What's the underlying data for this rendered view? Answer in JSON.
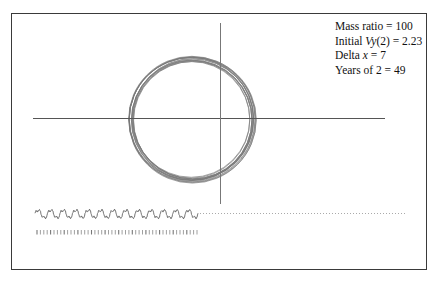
{
  "figure": {
    "legend": {
      "lines": [
        {
          "prefix": "Mass ratio = ",
          "italic": "",
          "suffix": "100"
        },
        {
          "prefix": "Initial ",
          "italic": "Vy",
          "suffix": "(2) = 2.23"
        },
        {
          "prefix": "Delta ",
          "italic": "x",
          "suffix": " = 7"
        },
        {
          "prefix": "Years of 2 = ",
          "italic": "",
          "suffix": "49"
        }
      ]
    },
    "params": {
      "mass_ratio": 100,
      "initial_vy2": 2.23,
      "delta_x": 7,
      "years_of_2": 49
    },
    "wave_cycles": 13,
    "tick_count": 48,
    "colors": {
      "frame": "#3a3a3a",
      "axes": "#555555",
      "orbit": "#777777",
      "wave": "#666666",
      "dots": "#aaaaaa",
      "ticks": "#777777"
    }
  }
}
